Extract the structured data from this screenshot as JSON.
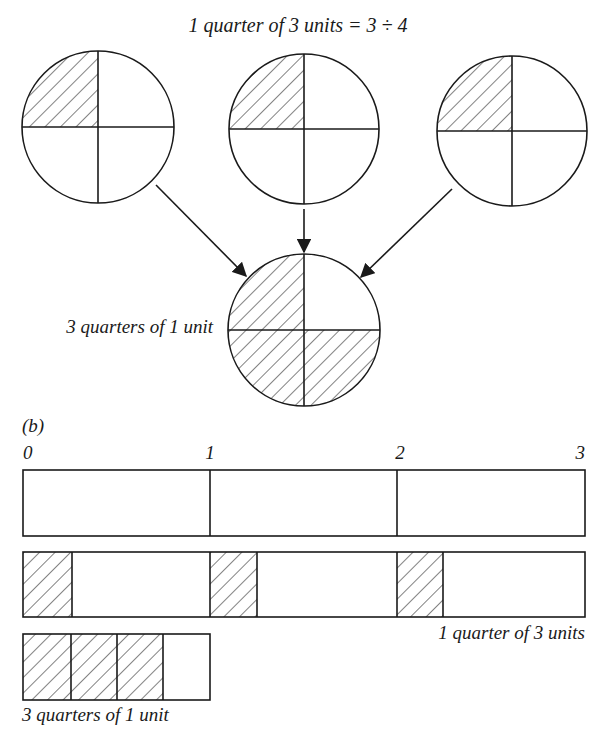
{
  "figure": {
    "colors": {
      "ink": "#1a1a1a",
      "background": "#ffffff"
    },
    "part_a": {
      "title": "1 quarter of 3 units = 3 ÷ 4",
      "source_circles": [
        {
          "cx": 98,
          "cy": 127,
          "r": 76,
          "shaded_quarters": [
            "top-left"
          ]
        },
        {
          "cx": 304,
          "cy": 129,
          "r": 75,
          "shaded_quarters": [
            "top-left"
          ]
        },
        {
          "cx": 512,
          "cy": 131,
          "r": 75,
          "shaded_quarters": [
            "top-left"
          ]
        }
      ],
      "result_circle": {
        "cx": 304,
        "cy": 330,
        "r": 76,
        "shaded_quarters": [
          "top-left",
          "bottom-left",
          "bottom-right"
        ]
      },
      "result_label": "3 quarters of 1 unit",
      "arrows": [
        {
          "from": [
            156,
            185
          ],
          "to": [
            246,
            276
          ]
        },
        {
          "from": [
            304,
            209
          ],
          "to": [
            304,
            248
          ]
        },
        {
          "from": [
            452,
            189
          ],
          "to": [
            361,
            277
          ]
        }
      ]
    },
    "part_b": {
      "label": "(b)",
      "ticks": [
        "0",
        "1",
        "2",
        "3"
      ],
      "bar_units": {
        "x": 23,
        "y": 470,
        "width": 562,
        "height": 66,
        "dividers": [
          210,
          397
        ]
      },
      "bar_quarters": {
        "x": 23,
        "y": 552,
        "width": 562,
        "height": 65,
        "shaded_segments": [
          [
            23,
            72
          ],
          [
            210,
            257
          ],
          [
            397,
            443
          ]
        ],
        "label": "1 quarter of 3 units"
      },
      "bar_result": {
        "x": 23,
        "y": 634,
        "width": 187,
        "height": 66,
        "dividers": [
          71,
          117,
          163
        ],
        "shaded_segments": [
          [
            23,
            163
          ]
        ],
        "label": "3 quarters of 1 unit"
      }
    }
  }
}
